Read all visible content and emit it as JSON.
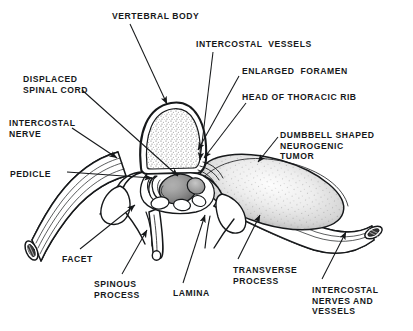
{
  "figure": {
    "kind": "anatomical-line-drawing",
    "ink_color": "#16181a",
    "background_color": "#ffffff",
    "tumor_fill": "#e9e9e9",
    "bone_fill": "#ffffff",
    "cord_fill": "#8d8d8d"
  },
  "labels": [
    {
      "id": "vertebral-body",
      "text": "VERTEBRAL BODY",
      "lines": [
        "VERTEBRAL BODY"
      ],
      "x": 112,
      "y": 11,
      "align": "left"
    },
    {
      "id": "intercostal-vessels",
      "text": "INTERCOSTAL VESSELS",
      "lines": [
        "INTERCOSTAL  VESSELS"
      ],
      "x": 196,
      "y": 39,
      "align": "left"
    },
    {
      "id": "enlarged-foramen",
      "text": "ENLARGED FORAMEN",
      "lines": [
        "ENLARGED  FORAMEN"
      ],
      "x": 242,
      "y": 66,
      "align": "left"
    },
    {
      "id": "head-of-thoracic-rib",
      "text": "HEAD OF THORACIC RIB",
      "lines": [
        "HEAD OF THORACIC RIB"
      ],
      "x": 242,
      "y": 92,
      "align": "left"
    },
    {
      "id": "displaced-spinal-cord",
      "text": "DISPLACED SPINAL CORD",
      "lines": [
        "DISPLACED",
        "SPINAL CORD"
      ],
      "x": 23,
      "y": 74,
      "align": "left"
    },
    {
      "id": "intercostal-nerve",
      "text": "INTERCOSTAL NERVE",
      "lines": [
        "INTERCOSTAL",
        "NERVE"
      ],
      "x": 9,
      "y": 118,
      "align": "left"
    },
    {
      "id": "pedicle",
      "text": "PEDICLE",
      "lines": [
        "PEDICLE"
      ],
      "x": 10,
      "y": 169,
      "align": "left"
    },
    {
      "id": "dumbbell-tumor",
      "text": "DUMBBELL SHAPED NEUROGENIC TUMOR",
      "lines": [
        "DUMBBELL SHAPED",
        "NEUROGENIC",
        "TUMOR"
      ],
      "x": 280,
      "y": 130,
      "align": "left"
    },
    {
      "id": "facet",
      "text": "FACET",
      "lines": [
        "FACET"
      ],
      "x": 62,
      "y": 254,
      "align": "left"
    },
    {
      "id": "spinous-process",
      "text": "SPINOUS PROCESS",
      "lines": [
        "SPINOUS",
        "PROCESS"
      ],
      "x": 94,
      "y": 279,
      "align": "left"
    },
    {
      "id": "lamina",
      "text": "LAMINA",
      "lines": [
        "LAMINA"
      ],
      "x": 173,
      "y": 288,
      "align": "left"
    },
    {
      "id": "transverse-process",
      "text": "TRANSVERSE PROCESS",
      "lines": [
        "TRANSVERSE",
        "PROCESS"
      ],
      "x": 233,
      "y": 265,
      "align": "left"
    },
    {
      "id": "intercostal-nerves-and-vessels",
      "text": "INTERCOSTAL NERVES AND VESSELS",
      "lines": [
        "INTERCOSTAL",
        "NERVES AND",
        "VESSELS"
      ],
      "x": 312,
      "y": 285,
      "align": "left"
    }
  ],
  "leader_lines": [
    {
      "id": "leader-vertebral-body",
      "from": [
        130,
        24
      ],
      "to": [
        167,
        104
      ],
      "arrow": true
    },
    {
      "id": "leader-intercostal-vessels",
      "from": [
        213,
        52
      ],
      "to": [
        200,
        160
      ],
      "arrow": true
    },
    {
      "id": "leader-enlarged-foramen",
      "from": [
        239,
        76
      ],
      "to": [
        198,
        150
      ],
      "arrow": true
    },
    {
      "id": "leader-head-thoracic-rib",
      "from": [
        246,
        103
      ],
      "to": [
        204,
        158
      ],
      "arrow": true
    },
    {
      "id": "leader-displaced-spinal-cord",
      "from": [
        82,
        90
      ],
      "to": [
        178,
        176
      ],
      "arrow": true
    },
    {
      "id": "leader-intercostal-nerve",
      "from": [
        72,
        128
      ],
      "to": [
        117,
        158
      ],
      "arrow": true
    },
    {
      "id": "leader-pedicle",
      "from": [
        67,
        172
      ],
      "to": [
        152,
        178
      ],
      "arrow": true
    },
    {
      "id": "leader-dumbbell-tumor",
      "from": [
        278,
        137
      ],
      "to": [
        258,
        162
      ],
      "arrow": true
    },
    {
      "id": "leader-facet",
      "from": [
        80,
        249
      ],
      "to": [
        135,
        205
      ],
      "arrow": true
    },
    {
      "id": "leader-spinous-process",
      "from": [
        122,
        274
      ],
      "to": [
        147,
        230
      ],
      "arrow": true
    },
    {
      "id": "leader-lamina",
      "from": [
        183,
        283
      ],
      "to": [
        205,
        215
      ],
      "arrow": true
    },
    {
      "id": "leader-transverse-process",
      "from": [
        238,
        259
      ],
      "to": [
        260,
        215
      ],
      "arrow": true
    },
    {
      "id": "leader-intercostal-nerves-vessels",
      "from": [
        322,
        279
      ],
      "to": [
        346,
        232
      ],
      "arrow": true
    }
  ]
}
